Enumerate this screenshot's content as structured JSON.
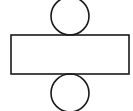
{
  "diagram": {
    "background": "#ffffff",
    "stroke_color": "#1a1a1a",
    "stroke_width": 1.6,
    "shapes": {
      "top_circle": {
        "cx": 70,
        "cy": 16,
        "r": 19
      },
      "rectangle": {
        "x": 11,
        "y": 35,
        "width": 118,
        "height": 39
      },
      "bottom_circle": {
        "cx": 70,
        "cy": 93,
        "r": 19
      }
    }
  }
}
